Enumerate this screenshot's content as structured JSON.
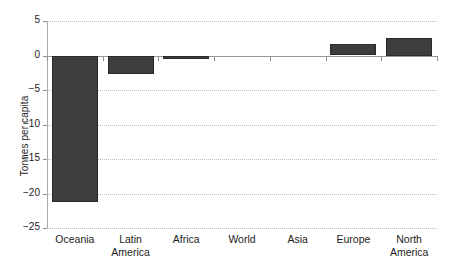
{
  "chart": {
    "ylabel": "Tonnes per capita",
    "bar_color": "#3d3d3d",
    "grid_color": "#b9b9b9",
    "axis_color": "#8f8f8f",
    "text_color": "#1c1c1c"
  },
  "chart_data": {
    "type": "bar",
    "title": "",
    "subtitle": "",
    "xlabel": "",
    "ylabel": "Tonnes per capita",
    "categories": [
      "Oceania",
      "Latin America",
      "Africa",
      "World",
      "Asia",
      "Europe",
      "North America"
    ],
    "values": [
      -21.3,
      -2.7,
      -0.5,
      0.0,
      0.0,
      1.6,
      2.5
    ],
    "ylim": [
      -25,
      5
    ],
    "yticks": [
      5,
      0,
      -5,
      -10,
      -15,
      -20,
      -25
    ],
    "ytick_labels": [
      "5",
      "0",
      "−5",
      "−10",
      "−15",
      "−20",
      "−25"
    ],
    "grid": true,
    "grid_axis": "y",
    "legend": null,
    "legend_position": "none",
    "orientation": "vertical"
  },
  "axis": {
    "y_tick_labels": [
      "5",
      "0",
      "−5",
      "−10",
      "−15",
      "−20",
      "−25"
    ],
    "x_tick_labels": [
      "Oceania",
      "Latin\nAmerica",
      "Africa",
      "World",
      "Asia",
      "Europe",
      "North\nAmerica"
    ]
  }
}
